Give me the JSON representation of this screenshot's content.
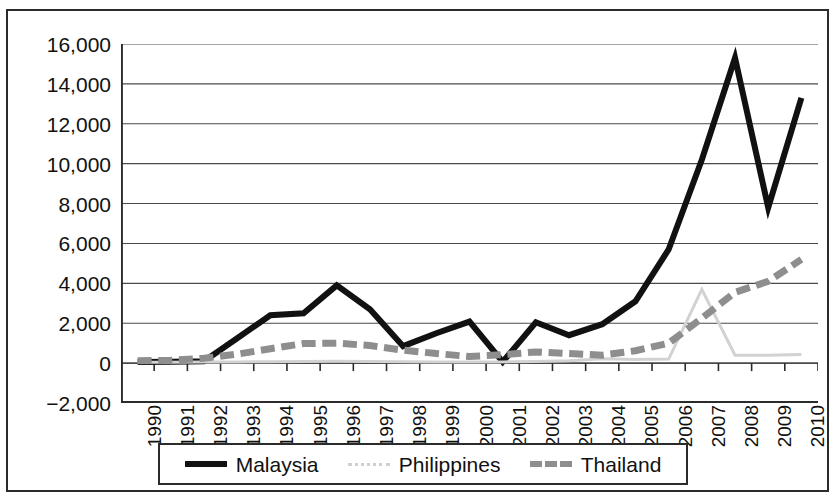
{
  "chart_data": {
    "type": "line",
    "title": "",
    "subtitle": "",
    "xlabel": "",
    "ylabel": "",
    "grid": "horizontal",
    "legend_position": "bottom",
    "x": [
      "1990",
      "1991",
      "1992",
      "1993",
      "1994",
      "1995",
      "1996",
      "1997",
      "1998",
      "1999",
      "2000",
      "2001",
      "2002",
      "2003",
      "2004",
      "2005",
      "2006",
      "2007",
      "2008",
      "2009",
      "2010"
    ],
    "xtick_labels": [
      "1990",
      "1991",
      "1992",
      "1993",
      "1994",
      "1995",
      "1996",
      "1997",
      "1998",
      "1999",
      "2000",
      "2001",
      "2002",
      "2003",
      "2004",
      "2005",
      "2006",
      "2007",
      "2008",
      "2009",
      "2010"
    ],
    "ytick_labels": [
      "16,000",
      "14,000",
      "12,000",
      "10,000",
      "8,000",
      "6,000",
      "4,000",
      "2,000",
      "0",
      "−2,000"
    ],
    "ytick_values": [
      16000,
      14000,
      12000,
      10000,
      8000,
      6000,
      4000,
      2000,
      0,
      -2000
    ],
    "ylim": [
      -2000,
      16000
    ],
    "series": [
      {
        "name": "Malaysia",
        "color": "#111111",
        "style": "solid",
        "width": 6,
        "values": [
          60,
          70,
          90,
          1250,
          2400,
          2500,
          3900,
          2700,
          850,
          1500,
          2080,
          60,
          2050,
          1400,
          1950,
          3100,
          5700,
          10200,
          15300,
          7800,
          13300
        ]
      },
      {
        "name": "Philippines",
        "color": "#d2d2d2",
        "style": "thin",
        "width": 3,
        "values": [
          40,
          45,
          50,
          60,
          70,
          80,
          90,
          80,
          70,
          60,
          50,
          60,
          80,
          120,
          220,
          180,
          200,
          3700,
          400,
          400,
          430
        ]
      },
      {
        "name": "Thailand",
        "color": "#8e8e8e",
        "style": "dashed",
        "width": 7,
        "values": [
          120,
          140,
          240,
          450,
          720,
          980,
          1000,
          880,
          650,
          480,
          330,
          420,
          560,
          480,
          400,
          620,
          1000,
          2250,
          3550,
          4100,
          5200
        ]
      }
    ]
  },
  "legend": {
    "items": [
      {
        "label": "Malaysia",
        "marker": "solid-line-swatch"
      },
      {
        "label": "Philippines",
        "marker": "dotted-line-swatch"
      },
      {
        "label": "Thailand",
        "marker": "dashed-line-swatch"
      }
    ]
  },
  "colors": {
    "malaysia": "#111111",
    "philippines": "#d2d2d2",
    "thailand": "#8e8e8e",
    "axis": "#2b2b2b",
    "grid": "#4a4a4a",
    "background": "#ffffff"
  }
}
